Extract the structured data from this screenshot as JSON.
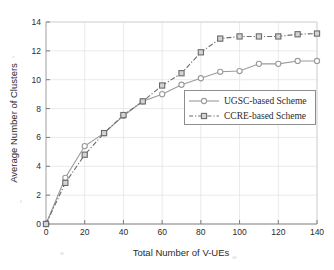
{
  "chart_data": {
    "type": "line",
    "title": "",
    "xlabel": "Total Number of V-UEs",
    "ylabel": "Average Number of Clusters",
    "xlim": [
      0,
      140
    ],
    "ylim": [
      0,
      14
    ],
    "xticks": [
      0,
      20,
      40,
      60,
      80,
      100,
      120,
      140
    ],
    "yticks": [
      0,
      2,
      4,
      6,
      8,
      10,
      12,
      14
    ],
    "xtick_labels": [
      "0",
      "20",
      "40",
      "60",
      "80",
      "100",
      "120",
      "140"
    ],
    "ytick_labels": [
      "0",
      "2",
      "4",
      "6",
      "8",
      "10",
      "12",
      "14"
    ],
    "grid": true,
    "legend_position": "center-right",
    "x": [
      0,
      10,
      20,
      30,
      40,
      50,
      60,
      70,
      80,
      90,
      100,
      110,
      120,
      130,
      140
    ],
    "series": [
      {
        "name": "UGSC-based Scheme",
        "values": [
          0,
          3.2,
          5.4,
          6.3,
          7.5,
          8.5,
          9.0,
          9.65,
          10.1,
          10.55,
          10.6,
          11.1,
          11.1,
          11.3,
          11.3
        ],
        "color": "#9a9a9a",
        "marker": "circle",
        "line_style": "solid"
      },
      {
        "name": "CCRE-based Scheme",
        "values": [
          0,
          2.85,
          4.8,
          6.3,
          7.55,
          8.5,
          9.6,
          10.45,
          11.9,
          12.85,
          13.0,
          13.0,
          13.0,
          13.15,
          13.2
        ],
        "color": "#6b6b6b",
        "marker": "square",
        "line_style": "dashdot"
      }
    ]
  },
  "axes": {
    "x_axis_label": "Total Number of V-UEs",
    "y_axis_label": "Average Number of Clusters"
  },
  "legend": {
    "entries": [
      {
        "label": "UGSC-based Scheme"
      },
      {
        "label": "CCRE-based Scheme"
      }
    ]
  },
  "colors": {
    "series_1": "#9a9a9a",
    "series_2": "#6b6b6b",
    "grid": "#e0e0e0",
    "axis": "#7a7a7a",
    "text": "#2b2b2b",
    "background": "#ffffff"
  }
}
